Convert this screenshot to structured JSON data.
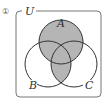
{
  "diagram": {
    "type": "venn",
    "item_number": "①",
    "universe_label": "U",
    "sets": [
      {
        "label": "A"
      },
      {
        "label": "B"
      },
      {
        "label": "C"
      }
    ],
    "shaded_regions": "A ∪ (B ∩ C)",
    "colors": {
      "shade": "#b5b5b5",
      "stroke": "#333333",
      "box": "#777777"
    }
  }
}
